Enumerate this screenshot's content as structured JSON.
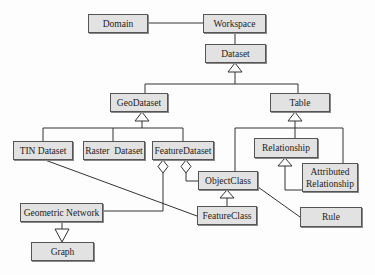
{
  "diagram": {
    "type": "uml-class-diagram",
    "nodes": {
      "domain": "Domain",
      "workspace": "Workspace",
      "dataset": "Dataset",
      "geodataset": "GeoDataset",
      "table": "Table",
      "tin_dataset": "TIN Dataset",
      "raster_dataset": "Raster  Dataset",
      "feature_dataset": "FeatureDataset",
      "relationship": "Relationship",
      "attributed_relationship": "Attributed\nRelationship",
      "object_class": "ObjectClass",
      "geometric_network": "Geometric Network",
      "feature_class": "FeatureClass",
      "rule": "Rule",
      "graph": "Graph"
    },
    "edges": [
      {
        "from": "Domain",
        "to": "Workspace",
        "kind": "association"
      },
      {
        "from": "Workspace",
        "to": "Dataset",
        "kind": "association"
      },
      {
        "from": "GeoDataset",
        "to": "Dataset",
        "kind": "generalization"
      },
      {
        "from": "Table",
        "to": "Dataset",
        "kind": "generalization"
      },
      {
        "from": "TIN Dataset",
        "to": "GeoDataset",
        "kind": "generalization"
      },
      {
        "from": "Raster  Dataset",
        "to": "GeoDataset",
        "kind": "generalization"
      },
      {
        "from": "FeatureDataset",
        "to": "GeoDataset",
        "kind": "generalization"
      },
      {
        "from": "ObjectClass",
        "to": "Table",
        "kind": "generalization"
      },
      {
        "from": "Relationship",
        "to": "Table",
        "kind": "generalization"
      },
      {
        "from": "Attributed\nRelationship",
        "to": "Table",
        "kind": "generalization"
      },
      {
        "from": "Attributed\nRelationship",
        "to": "Relationship",
        "kind": "generalization"
      },
      {
        "from": "FeatureDataset",
        "to": "Geometric Network",
        "kind": "aggregation"
      },
      {
        "from": "FeatureDataset",
        "to": "ObjectClass",
        "kind": "aggregation"
      },
      {
        "from": "FeatureClass",
        "to": "ObjectClass",
        "kind": "generalization"
      },
      {
        "from": "TIN Dataset",
        "to": "FeatureClass",
        "kind": "association"
      },
      {
        "from": "ObjectClass",
        "to": "Rule",
        "kind": "association"
      },
      {
        "from": "Geometric Network",
        "to": "Graph",
        "kind": "generalization"
      }
    ]
  }
}
